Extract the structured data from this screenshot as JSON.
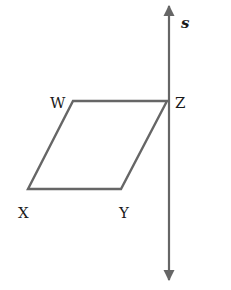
{
  "diagram": {
    "type": "geometry-figure",
    "line": {
      "label": "s",
      "stroke": "#666666"
    },
    "parallelogram": {
      "stroke": "#666666",
      "vertices": [
        {
          "label": "W"
        },
        {
          "label": "Z"
        },
        {
          "label": "Y"
        },
        {
          "label": "X"
        }
      ]
    }
  }
}
